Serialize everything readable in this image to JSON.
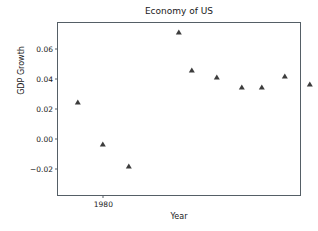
{
  "chart_data": {
    "type": "scatter",
    "title": "Economy of US",
    "xlabel": "Year",
    "ylabel": "GDP Growth",
    "grid": false,
    "legend": null,
    "marker": "triangle-up",
    "marker_color": "#3c3c3c",
    "xlim": [
      1978.2,
      1987.8
    ],
    "ylim": [
      -0.0375,
      0.0775
    ],
    "xticks": [
      1980,
      1990,
      2000,
      2010,
      2020
    ],
    "xtick_labels": [
      "1980",
      "1990",
      "2000",
      "2010",
      "2020"
    ],
    "yticks": [
      -0.02,
      0.0,
      0.02,
      0.04,
      0.06
    ],
    "ytick_labels": [
      "−0.02",
      "0.00",
      "0.02",
      "0.04",
      "0.06"
    ],
    "x": [
      1979,
      1980,
      1981,
      1982,
      1983,
      1984,
      1985,
      1986,
      1987,
      1988,
      1989,
      1990,
      1991,
      1992,
      1993,
      1994,
      1995,
      1996,
      1997,
      1998,
      1999,
      2000,
      2001,
      2002,
      2003,
      2004,
      2005,
      2006,
      2007,
      2008,
      2009,
      2010,
      2011,
      2012,
      2013,
      2014,
      2015,
      2016,
      2017,
      2018,
      2019,
      2020,
      2021,
      2022,
      2023,
      2024,
      2025,
      2026
    ],
    "y": [
      0.0248,
      -0.0035,
      -0.0184,
      0.0713,
      0.0461,
      0.0415,
      0.0349,
      0.0349,
      0.0419,
      0.0366,
      0.0191,
      -0.0012,
      0.0352,
      0.0281,
      0.0401,
      0.0269,
      0.0379,
      0.0437,
      0.0453,
      0.0479,
      0.0412,
      0.0101,
      0.0172,
      0.0281,
      0.0391,
      0.0351,
      0.0281,
      0.0199,
      0.0007,
      -0.0259,
      0.0269,
      0.0161,
      0.0228,
      0.0181,
      0.0263,
      0.0237,
      0.0172,
      0.0233,
      0.0289,
      0.0231,
      -0.0329,
      0.0576,
      0.0159,
      0.0102,
      0.0113,
      0.0182,
      0.0209,
      0.0196
    ],
    "points": [
      {
        "x": 1979,
        "y": 0.0248
      },
      {
        "x": 1980,
        "y": -0.0035
      },
      {
        "x": 1981,
        "y": -0.0184
      },
      {
        "x": 1983,
        "y": 0.0713
      },
      {
        "x": 1983.5,
        "y": 0.0461
      },
      {
        "x": 1984.5,
        "y": 0.0415
      },
      {
        "x": 1985.5,
        "y": 0.0349
      },
      {
        "x": 1986.3,
        "y": 0.0349
      },
      {
        "x": 1987.2,
        "y": 0.0419
      },
      {
        "x": 1988.2,
        "y": 0.0366
      },
      {
        "x": 1989.5,
        "y": 0.0191
      },
      {
        "x": 1990.8,
        "y": -0.0012
      },
      {
        "x": 1991.5,
        "y": 0.0352
      },
      {
        "x": 1992.8,
        "y": 0.0281
      },
      {
        "x": 1993.8,
        "y": 0.0401
      },
      {
        "x": 1994.8,
        "y": 0.0269
      },
      {
        "x": 1995.8,
        "y": 0.0379
      },
      {
        "x": 1996.5,
        "y": 0.0437
      },
      {
        "x": 1997.5,
        "y": 0.0453
      },
      {
        "x": 1998.3,
        "y": 0.0479
      },
      {
        "x": 1999.5,
        "y": 0.0412
      },
      {
        "x": 2000.8,
        "y": 0.0101
      },
      {
        "x": 2002.0,
        "y": 0.0172
      },
      {
        "x": 2002.8,
        "y": 0.0281
      },
      {
        "x": 2003.8,
        "y": 0.0391
      },
      {
        "x": 2004.8,
        "y": 0.0351
      },
      {
        "x": 2005.8,
        "y": 0.0281
      },
      {
        "x": 2006.5,
        "y": 0.0199
      },
      {
        "x": 2008.0,
        "y": 0.0007
      },
      {
        "x": 2008.8,
        "y": -0.0259
      },
      {
        "x": 2009.8,
        "y": 0.0269
      },
      {
        "x": 2011.0,
        "y": 0.0161
      },
      {
        "x": 2011.8,
        "y": 0.0228
      },
      {
        "x": 2012.8,
        "y": 0.0181
      },
      {
        "x": 2013.8,
        "y": 0.0263
      },
      {
        "x": 2014.8,
        "y": 0.0237
      },
      {
        "x": 2015.6,
        "y": 0.0172
      },
      {
        "x": 2016.5,
        "y": 0.0233
      },
      {
        "x": 2017.5,
        "y": 0.0289
      },
      {
        "x": 2018.5,
        "y": 0.0231
      },
      {
        "x": 2020.0,
        "y": -0.0329
      },
      {
        "x": 2021.0,
        "y": 0.0576
      },
      {
        "x": 2021.8,
        "y": 0.0159
      },
      {
        "x": 2023.0,
        "y": 0.0102
      },
      {
        "x": 2023.6,
        "y": 0.0113
      },
      {
        "x": 2024.8,
        "y": 0.0182
      },
      {
        "x": 2025.5,
        "y": 0.0209
      },
      {
        "x": 2026.3,
        "y": 0.0196
      }
    ]
  }
}
